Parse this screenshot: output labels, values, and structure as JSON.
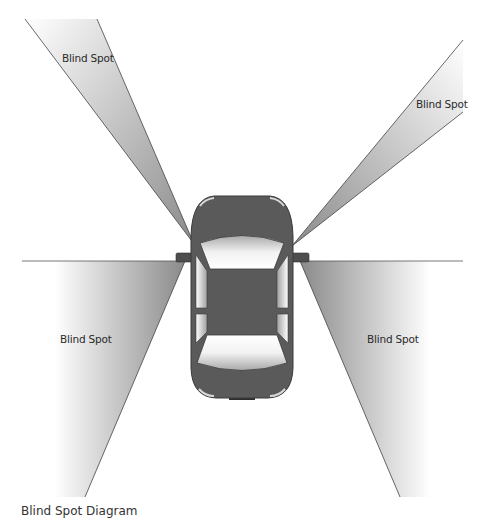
{
  "diagram": {
    "title": "Blind Spot Diagram",
    "labels": {
      "top_left": "Blind Spot",
      "top_right": "Blind Spot",
      "bottom_left": "Blind Spot",
      "bottom_right": "Blind Spot"
    },
    "colors": {
      "car_body": "#5a5a5a",
      "car_outline": "#3a3a3a",
      "glass_light": "#f4f4f4",
      "glass_dark": "#9a9a9a",
      "zone_dark": "#8c8c8c",
      "zone_light": "#ffffff",
      "line": "#444444"
    }
  }
}
